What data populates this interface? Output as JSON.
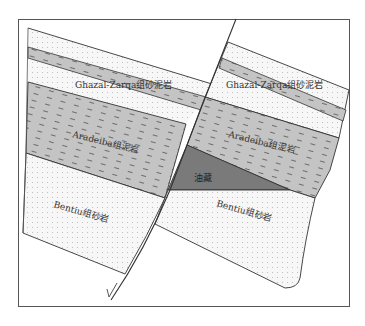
{
  "diagram": {
    "title": "",
    "colors": {
      "sandstone_fill": "#f7f7f7",
      "sandstone_dot": "#b8b8b8",
      "mudstone_fill": "#c4c4c4",
      "mudstone_dash": "#555555",
      "oil_fill": "#7a7a7a",
      "line": "#333333",
      "frame": "#555555"
    },
    "labels": {
      "ghazal_left": "Ghazal-Zarqa组砂泥岩",
      "ghazal_right": "Ghazal-Zarqa组砂泥岩",
      "aradeiba_left": "Aradeiba组泥岩",
      "aradeiba_right": "Aradeiba组泥岩",
      "bentiu_left": "Bentiu组砂岩",
      "bentiu_right": "Bentiu组砂岩",
      "oil_reservoir": "油藏"
    },
    "units": [
      {
        "name": "Ghazal-Zarqa组砂泥岩",
        "lithology": "sandstone-mudstone interbed"
      },
      {
        "name": "Aradeiba组泥岩",
        "lithology": "mudstone"
      },
      {
        "name": "Bentiu组砂岩",
        "lithology": "sandstone"
      },
      {
        "name": "油藏",
        "lithology": "oil reservoir"
      }
    ],
    "fault": {
      "type": "normal fault",
      "sense_marker": "half-arrow"
    }
  }
}
